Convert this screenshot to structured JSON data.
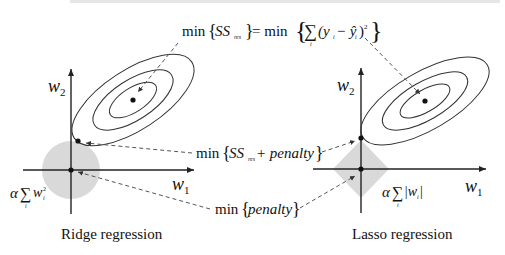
{
  "top_strip": "cut-off text (illegible)",
  "formulas": {
    "ss_res": {
      "prefix": "min",
      "lhs": "SS",
      "lhs_sub": "res",
      "eq": "= min",
      "sum": "∑",
      "sum_sub": "i",
      "term": "(y",
      "term_sub": "i",
      "minus": " − ŷ",
      "term_sub2": "i",
      "close": ")",
      "power": "2"
    },
    "ss_penalty": {
      "prefix": "min",
      "body": "SS",
      "sub": "res",
      "plus": " + penalty"
    },
    "penalty": {
      "prefix": "min",
      "body": "penalty"
    }
  },
  "ridge": {
    "caption": "Ridge regression",
    "axis_x": "w",
    "axis_x_sub": "1",
    "axis_y": "w",
    "axis_y_sub": "2",
    "penalty_alpha": "α",
    "penalty_sum": "∑",
    "penalty_sum_sub": "i",
    "penalty_w": "w",
    "penalty_w_sub": "i",
    "penalty_w_sup": "2",
    "region_shape": "circle"
  },
  "lasso": {
    "caption": "Lasso regression",
    "axis_x": "w",
    "axis_x_sub": "1",
    "axis_y": "w",
    "axis_y_sub": "2",
    "penalty_alpha": "α",
    "penalty_sum": "∑",
    "penalty_sum_sub": "i",
    "penalty_abs": "|w",
    "penalty_abs_sub": "i",
    "penalty_abs_close": "|",
    "region_shape": "diamond"
  },
  "colors": {
    "region": "#d9d9d9",
    "line": "#222222",
    "dash": "#555555"
  }
}
